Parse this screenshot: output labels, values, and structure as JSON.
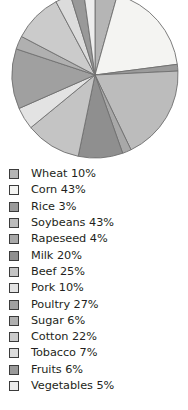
{
  "chart_data": {
    "type": "pie",
    "title": "",
    "legend_position": "bottom",
    "grid": false,
    "categories": [
      "Wheat",
      "Corn",
      "Rice",
      "Soybeans",
      "Rapeseed",
      "Milk",
      "Beef",
      "Pork",
      "Poultry",
      "Sugar",
      "Cotton",
      "Tobacco",
      "Fruits",
      "Vegetables"
    ],
    "values": [
      10,
      43,
      3,
      43,
      4,
      20,
      25,
      10,
      27,
      6,
      22,
      7,
      6,
      5
    ],
    "unit": "%",
    "colors": [
      "#b5b5b5",
      "#f4f4f2",
      "#9a9a9a",
      "#bcbcbc",
      "#a8a8a8",
      "#8f8f8f",
      "#c4c4c4",
      "#e3e3e3",
      "#a0a0a0",
      "#b0b0b0",
      "#cbcbcb",
      "#dcdcdc",
      "#999999",
      "#ededed"
    ],
    "slice_stroke": "#6f6f6f",
    "start_angle_deg": -90,
    "direction": "clockwise"
  },
  "legend": {
    "items": [
      {
        "label": "Wheat 10%",
        "swatch": "#b5b5b5"
      },
      {
        "label": "Corn 43%",
        "swatch": "#f4f4f2"
      },
      {
        "label": "Rice 3%",
        "swatch": "#9a9a9a"
      },
      {
        "label": "Soybeans 43%",
        "swatch": "#bcbcbc"
      },
      {
        "label": "Rapeseed 4%",
        "swatch": "#a8a8a8"
      },
      {
        "label": "Milk 20%",
        "swatch": "#8f8f8f"
      },
      {
        "label": "Beef 25%",
        "swatch": "#c4c4c4"
      },
      {
        "label": "Pork 10%",
        "swatch": "#e3e3e3"
      },
      {
        "label": "Poultry 27%",
        "swatch": "#a0a0a0"
      },
      {
        "label": "Sugar 6%",
        "swatch": "#b0b0b0"
      },
      {
        "label": "Cotton 22%",
        "swatch": "#cbcbcb"
      },
      {
        "label": "Tobacco 7%",
        "swatch": "#dcdcdc"
      },
      {
        "label": "Fruits 6%",
        "swatch": "#999999"
      },
      {
        "label": "Vegetables 5%",
        "swatch": "#ededed"
      }
    ]
  }
}
